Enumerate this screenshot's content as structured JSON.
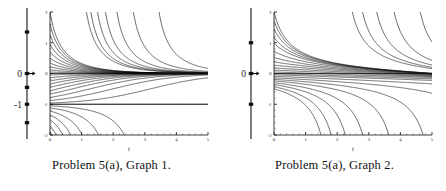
{
  "figures": [
    {
      "caption": "Problem 5(a), Graph 1.",
      "chart_index": 0
    },
    {
      "caption": "Problem 5(a), Graph 2.",
      "chart_index": 1
    }
  ],
  "chart_data": [
    {
      "type": "line",
      "title": "Problem 5(a), Graph 1.",
      "xlabel": "t",
      "ylabel": "",
      "xlim": [
        0,
        5
      ],
      "ylim": [
        -2,
        2
      ],
      "xticks": [
        0,
        1,
        2,
        3,
        4,
        5
      ],
      "xticklabels": [
        "0",
        "1",
        "2",
        "3",
        "4",
        "5"
      ],
      "yticks": [
        -2,
        -1,
        0,
        1,
        2
      ],
      "yticklabels": [
        "-2",
        "-1",
        "0",
        "1",
        "2"
      ],
      "grid": false,
      "legend": false,
      "description": "Family of solution curves of an autonomous ODE; curves above y=0 decay toward the horizontal asymptote y=0, curves between -1 and 0 rise toward 0, and curves below y=-1 fall steeply to -2. A straight equilibrium solution line is drawn at y=-1.",
      "equilibria": [
        {
          "value": 0,
          "label": "0",
          "stability": "stable"
        },
        {
          "value": -1,
          "label": "-1",
          "stability": "unstable"
        }
      ],
      "equilibrium_lines": [
        0,
        -1
      ],
      "phase_line": {
        "axis_range": [
          -2,
          2
        ],
        "labels": [
          {
            "value": 0,
            "text": "0"
          },
          {
            "value": -1,
            "text": "-1"
          }
        ],
        "node_values": [
          1.35,
          0,
          -0.45,
          -1,
          -1.6
        ],
        "arrow_values": [
          0
        ]
      },
      "series": [
        {
          "name": "c=2.00",
          "y0": 2.0
        },
        {
          "name": "c=1.60",
          "y0": 1.6
        },
        {
          "name": "c=1.25",
          "y0": 1.25
        },
        {
          "name": "c=0.95",
          "y0": 0.95
        },
        {
          "name": "c=0.70",
          "y0": 0.7
        },
        {
          "name": "c=0.50",
          "y0": 0.5
        },
        {
          "name": "c=0.34",
          "y0": 0.34
        },
        {
          "name": "c=0.22",
          "y0": 0.22
        },
        {
          "name": "c=0.12",
          "y0": 0.12
        },
        {
          "name": "c=0.05",
          "y0": 0.05
        },
        {
          "name": "c=-0.05",
          "y0": -0.05
        },
        {
          "name": "c=-0.14",
          "y0": -0.14
        },
        {
          "name": "c=-0.24",
          "y0": -0.24
        },
        {
          "name": "c=-0.34",
          "y0": -0.34
        },
        {
          "name": "c=-0.45",
          "y0": -0.45
        },
        {
          "name": "c=-0.56",
          "y0": -0.56
        },
        {
          "name": "c=-0.67",
          "y0": -0.67
        },
        {
          "name": "c=-0.78",
          "y0": -0.78
        },
        {
          "name": "c=-0.88",
          "y0": -0.88
        },
        {
          "name": "c=-0.96",
          "y0": -0.96
        },
        {
          "name": "c=-1.00",
          "y0": -1.0
        },
        {
          "name": "c=-1.05",
          "y0": -1.05
        },
        {
          "name": "c=-1.12",
          "y0": -1.12
        },
        {
          "name": "c=-1.22",
          "y0": -1.22
        },
        {
          "name": "c=-1.35",
          "y0": -1.35
        },
        {
          "name": "c=-1.50",
          "y0": -1.5
        },
        {
          "name": "c=-1.70",
          "y0": -1.7
        },
        {
          "name": "c=-1.90",
          "y0": -1.9
        }
      ]
    },
    {
      "type": "line",
      "title": "Problem 5(a), Graph 2.",
      "xlabel": "t",
      "ylabel": "",
      "xlim": [
        0,
        5
      ],
      "ylim": [
        -2,
        2
      ],
      "xticks": [
        0,
        1,
        2,
        3,
        4,
        5
      ],
      "xticklabels": [
        "0",
        "1",
        "2",
        "3",
        "4",
        "5"
      ],
      "yticks": [
        -2,
        -1,
        0,
        1,
        2
      ],
      "yticklabels": [
        "-2",
        "-1",
        "0",
        "1",
        "2"
      ],
      "grid": false,
      "legend": false,
      "description": "Family of solution curves converging into a narrow band near y=0 that drifts slightly downward, while the lowest curves peel away and plunge toward -2 near t=4.5 to 5.",
      "equilibria": [
        {
          "value": 0,
          "label": "0",
          "stability": "semi-stable"
        }
      ],
      "equilibrium_lines": [
        0
      ],
      "phase_line": {
        "axis_range": [
          -2,
          2
        ],
        "labels": [
          {
            "value": 0,
            "text": "0"
          }
        ],
        "node_values": [
          1.0,
          0,
          -1.0
        ],
        "arrow_values": [
          0
        ]
      },
      "series": [
        {
          "name": "c=2.00",
          "y0": 2.0
        },
        {
          "name": "c=1.72",
          "y0": 1.72
        },
        {
          "name": "c=1.45",
          "y0": 1.45
        },
        {
          "name": "c=1.18",
          "y0": 1.18
        },
        {
          "name": "c=0.98",
          "y0": 0.98
        },
        {
          "name": "c=0.72",
          "y0": 0.72
        },
        {
          "name": "c=0.52",
          "y0": 0.52
        },
        {
          "name": "c=0.38",
          "y0": 0.38
        },
        {
          "name": "c=0.27",
          "y0": 0.27
        },
        {
          "name": "c=0.18",
          "y0": 0.18
        },
        {
          "name": "c=0.11",
          "y0": 0.11
        },
        {
          "name": "c=0.05",
          "y0": 0.05
        },
        {
          "name": "c=0.00",
          "y0": 0.0
        },
        {
          "name": "c=-0.04",
          "y0": -0.04
        },
        {
          "name": "c=-0.09",
          "y0": -0.09
        },
        {
          "name": "c=-0.14",
          "y0": -0.14
        },
        {
          "name": "c=-0.19",
          "y0": -0.19
        },
        {
          "name": "c=-0.24",
          "y0": -0.24
        },
        {
          "name": "c=-0.30",
          "y0": -0.3
        },
        {
          "name": "c=-0.36",
          "y0": -0.36
        },
        {
          "name": "c=-0.43",
          "y0": -0.43
        },
        {
          "name": "c=-0.50",
          "y0": -0.5
        }
      ]
    }
  ]
}
